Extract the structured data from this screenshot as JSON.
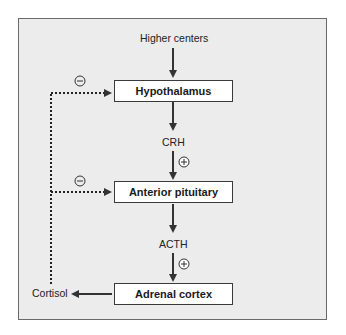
{
  "diagram": {
    "type": "hormone-axis-feedback",
    "input_label": "Higher centers",
    "nodes": [
      {
        "id": "hypothalamus",
        "label": "Hypothalamus"
      },
      {
        "id": "anterior-pituitary",
        "label": "Anterior pituitary"
      },
      {
        "id": "adrenal-cortex",
        "label": "Adrenal cortex"
      }
    ],
    "hormones": [
      {
        "label": "CRH",
        "effect": "+"
      },
      {
        "label": "ACTH",
        "effect": "+"
      }
    ],
    "output_label": "Cortisol",
    "feedback": [
      {
        "target": "Hypothalamus",
        "effect": "−",
        "style": "dotted"
      },
      {
        "target": "Anterior pituitary",
        "effect": "−",
        "style": "dotted"
      }
    ],
    "colors": {
      "panel_bg": "#ececec",
      "panel_border": "#6a6a6a",
      "arrow": "#333333",
      "node_bg": "#ffffff"
    }
  }
}
